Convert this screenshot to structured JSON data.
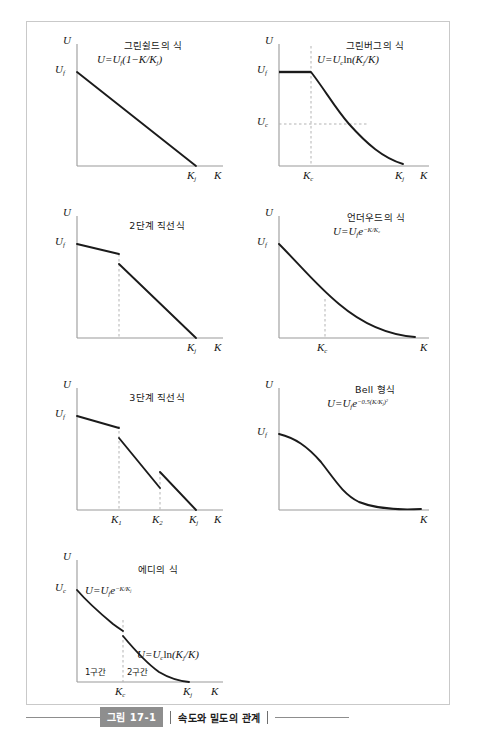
{
  "figure": {
    "caption_number": "그림 17-1",
    "caption_title": "속도와 밀도의 관계"
  },
  "panels": [
    {
      "id": "greenshields",
      "title": "그린쉴드의 식",
      "formula_html": "<span class=\"up\">U</span>=<span class=\"up\">U</span><sub>f</sub>(1−<span class=\"up\">K</span>/<span class=\"up\">K</span><sub>j</sub>)",
      "y_axis_label": "U",
      "x_axis_label": "K",
      "y_ticks": [
        "U<sub>f</sub>"
      ],
      "x_ticks": [
        "K<sub>j</sub>"
      ]
    },
    {
      "id": "greenberg",
      "title": "그린버그의 식",
      "formula_html": "<span class=\"up\">U</span>=<span class=\"up\">U</span><sub>c</sub><span class=\"rm\">ln</span>(<span class=\"up\">K</span><sub>j</sub>/<span class=\"up\">K</span>)",
      "y_axis_label": "U",
      "x_axis_label": "K",
      "y_ticks": [
        "U<sub>f</sub>",
        "U<sub>c</sub>"
      ],
      "x_ticks": [
        "K<sub>c</sub>",
        "K<sub>j</sub>"
      ]
    },
    {
      "id": "two-stage-linear",
      "title": "2단계 직선식",
      "formula_html": "",
      "y_axis_label": "U",
      "x_axis_label": "K",
      "y_ticks": [
        "U<sub>f</sub>"
      ],
      "x_ticks": [
        "K<sub>j</sub>"
      ]
    },
    {
      "id": "underwood",
      "title": "언더우드의 식",
      "formula_html": "<span class=\"up\">U</span>=<span class=\"up\">U</span><sub>f</sub><span class=\"up\">e</span><sup>−<span class=\"up\">K</span>/<span class=\"up\">K</span><sub>c</sub></sup>",
      "y_axis_label": "U",
      "x_axis_label": "K",
      "y_ticks": [
        "U<sub>f</sub>"
      ],
      "x_ticks": [
        "K<sub>c</sub>"
      ]
    },
    {
      "id": "three-stage-linear",
      "title": "3단계 직선식",
      "formula_html": "",
      "y_axis_label": "U",
      "x_axis_label": "K",
      "y_ticks": [
        "U<sub>f</sub>"
      ],
      "x_ticks": [
        "K<sub>1</sub>",
        "K<sub>2</sub>",
        "K<sub>j</sub>"
      ]
    },
    {
      "id": "bell",
      "title": "Bell 형식",
      "formula_html": "<span class=\"up\">U</span>=<span class=\"up\">U</span><sub>f</sub><span class=\"up\">e</span><sup>−0.5(<span class=\"up\">K</span>/<span class=\"up\">K</span><sub>j</sub>)<sup>2</sup></sup>",
      "y_axis_label": "U",
      "x_axis_label": "K",
      "y_ticks": [
        "U<sub>f</sub>"
      ],
      "x_ticks": []
    },
    {
      "id": "eddie",
      "title": "에디의 식",
      "formula_1_html": "<span class=\"up\">U</span>=<span class=\"up\">U</span><sub>f</sub><span class=\"up\">e</span><sup>−<span class=\"up\">K</span>/<span class=\"up\">K</span><sub>j</sub></sup>",
      "formula_2_html": "<span class=\"up\">U</span>=<span class=\"up\">U</span><sub>c</sub><span class=\"rm\">ln</span>(<span class=\"up\">K</span><sub>j</sub>/<span class=\"up\">K</span>)",
      "y_axis_label": "U",
      "x_axis_label": "K",
      "y_ticks": [
        "U<sub>c</sub>"
      ],
      "x_ticks": [
        "K<sub>c</sub>",
        "K<sub>j</sub>"
      ],
      "segment_labels": [
        "1구간",
        "2구간"
      ]
    }
  ],
  "chart_data": [
    {
      "type": "line",
      "id": "greenshields",
      "title": "그린쉴드의 식",
      "xlabel": "K",
      "ylabel": "U",
      "equation": "U = U_f (1 - K/K_j)",
      "xlim": [
        0,
        1.18
      ],
      "ylim": [
        0,
        1.15
      ],
      "x": [
        0.0,
        0.25,
        0.5,
        0.75,
        1.0
      ],
      "y": [
        0.86,
        0.645,
        0.43,
        0.215,
        0.0
      ],
      "x_tick_values": [
        1.0
      ],
      "x_tick_labels": [
        "K_j"
      ],
      "y_tick_values": [
        0.86
      ],
      "y_tick_labels": [
        "U_f"
      ],
      "grid": false,
      "legend": "none"
    },
    {
      "type": "line",
      "id": "greenberg",
      "title": "그린버그의 식",
      "xlabel": "K",
      "ylabel": "U",
      "equation": "U = U_c ln(K_j / K)",
      "xlim": [
        0,
        1.18
      ],
      "ylim": [
        0,
        1.15
      ],
      "x": [
        0.0,
        0.22,
        0.22,
        0.33,
        0.45,
        0.58,
        0.72,
        0.86,
        1.0
      ],
      "y": [
        0.86,
        0.86,
        0.86,
        0.62,
        0.45,
        0.32,
        0.2,
        0.1,
        0.0
      ],
      "x_tick_values": [
        0.22,
        1.0
      ],
      "x_tick_labels": [
        "K_c",
        "K_j"
      ],
      "y_tick_values": [
        0.86,
        0.36
      ],
      "y_tick_labels": [
        "U_f",
        "U_c"
      ],
      "dashed_guides": {
        "vertical_at_x": 0.22,
        "horizontal_at_y": 0.36
      },
      "grid": false,
      "legend": "none"
    },
    {
      "type": "line",
      "id": "two-stage-linear",
      "title": "2단계 직선식",
      "xlabel": "K",
      "ylabel": "U",
      "xlim": [
        0,
        1.18
      ],
      "ylim": [
        0,
        1.15
      ],
      "segments": [
        {
          "x": [
            0.0,
            0.3
          ],
          "y": [
            0.86,
            0.73
          ]
        },
        {
          "x": [
            0.3,
            1.0
          ],
          "y": [
            0.645,
            0.0
          ]
        }
      ],
      "x_tick_values": [
        1.0
      ],
      "x_tick_labels": [
        "K_j"
      ],
      "y_tick_values": [
        0.86
      ],
      "y_tick_labels": [
        "U_f"
      ],
      "dashed_guides": {
        "vertical_at_x": 0.3
      },
      "grid": false,
      "legend": "none"
    },
    {
      "type": "line",
      "id": "underwood",
      "title": "언더우드의 식",
      "xlabel": "K",
      "ylabel": "U",
      "equation": "U = U_f e^(-K/K_c)",
      "xlim": [
        0,
        1.18
      ],
      "ylim": [
        0,
        1.15
      ],
      "x": [
        0.0,
        0.15,
        0.3,
        0.45,
        0.6,
        0.75,
        0.9,
        1.0
      ],
      "y": [
        0.86,
        0.67,
        0.51,
        0.37,
        0.25,
        0.15,
        0.07,
        0.03
      ],
      "x_tick_values": [
        0.33
      ],
      "x_tick_labels": [
        "K_c"
      ],
      "y_tick_values": [
        0.86
      ],
      "y_tick_labels": [
        "U_f"
      ],
      "dashed_guides": {
        "vertical_at_x": 0.33
      },
      "grid": false,
      "legend": "none"
    },
    {
      "type": "line",
      "id": "three-stage-linear",
      "title": "3단계 직선식",
      "xlabel": "K",
      "ylabel": "U",
      "xlim": [
        0,
        1.18
      ],
      "ylim": [
        0,
        1.15
      ],
      "segments": [
        {
          "x": [
            0.0,
            0.3
          ],
          "y": [
            0.86,
            0.73
          ]
        },
        {
          "x": [
            0.3,
            0.62
          ],
          "y": [
            0.645,
            0.23
          ]
        },
        {
          "x": [
            0.62,
            0.9
          ],
          "y": [
            0.3,
            0.0
          ]
        }
      ],
      "x_tick_values": [
        0.3,
        0.62,
        0.9
      ],
      "x_tick_labels": [
        "K_1",
        "K_2",
        "K_j"
      ],
      "y_tick_values": [
        0.86
      ],
      "y_tick_labels": [
        "U_f"
      ],
      "dashed_guides": {
        "vertical_at_x": [
          0.3,
          0.62
        ]
      },
      "grid": false,
      "legend": "none"
    },
    {
      "type": "line",
      "id": "bell",
      "title": "Bell 형식",
      "xlabel": "K",
      "ylabel": "U",
      "equation": "U = U_f e^(-0.5(K/K_j)^2)",
      "xlim": [
        0,
        1.18
      ],
      "ylim": [
        0,
        1.15
      ],
      "x": [
        0.0,
        0.12,
        0.24,
        0.36,
        0.45,
        0.54,
        0.66,
        0.78,
        0.9,
        1.0
      ],
      "y": [
        0.62,
        0.6,
        0.54,
        0.44,
        0.33,
        0.22,
        0.12,
        0.06,
        0.02,
        0.01
      ],
      "x_tick_values": [],
      "x_tick_labels": [],
      "y_tick_values": [
        0.62
      ],
      "y_tick_labels": [
        "U_f"
      ],
      "grid": false,
      "legend": "none"
    },
    {
      "type": "line",
      "id": "eddie",
      "title": "에디의 식",
      "xlabel": "K",
      "ylabel": "U",
      "equation_segment_1": "U = U_f e^(-K/K_j)",
      "equation_segment_2": "U = U_c ln(K_j / K)",
      "xlim": [
        0,
        1.18
      ],
      "ylim": [
        0,
        1.15
      ],
      "segments": [
        {
          "name": "1구간",
          "x": [
            0.0,
            0.1,
            0.2,
            0.3,
            0.4
          ],
          "y": [
            0.86,
            0.68,
            0.55,
            0.45,
            0.4
          ]
        },
        {
          "name": "2구간",
          "x": [
            0.4,
            0.5,
            0.62,
            0.75,
            0.88
          ],
          "y": [
            0.33,
            0.22,
            0.13,
            0.06,
            0.02
          ]
        }
      ],
      "x_tick_values": [
        0.4,
        0.88
      ],
      "x_tick_labels": [
        "K_c",
        "K_j"
      ],
      "y_tick_values": [
        0.86
      ],
      "y_tick_labels": [
        "U_c"
      ],
      "dashed_guides": {
        "vertical_at_x": 0.4
      },
      "grid": false,
      "legend": "none"
    }
  ]
}
